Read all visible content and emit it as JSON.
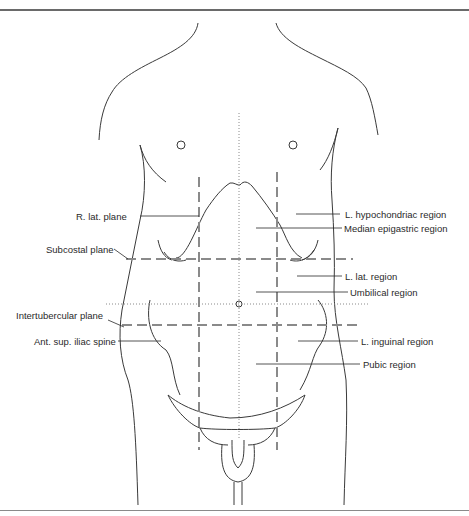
{
  "figure": {
    "line_color": "#3a3a3a",
    "plane_color": "#8a8a8a"
  },
  "labels_left": {
    "r_lat_plane": "R. lat. plane",
    "subcostal_plane": "Subcostal plane",
    "intertubercular_plane": "Intertubercular plane",
    "ant_sup_iliac_spine": "Ant. sup. iliac spine"
  },
  "labels_right": {
    "l_hypochondriac_region": "L. hypochondriac region",
    "median_epigastric_region": "Median epigastric region",
    "l_lat_region": "L. lat. region",
    "umbilical_region": "Umbilical region",
    "l_inguinal_region": "L. inguinal region",
    "pubic_region": "Pubic region"
  }
}
